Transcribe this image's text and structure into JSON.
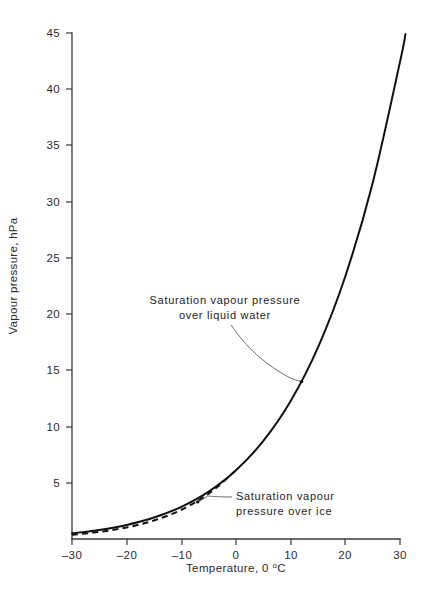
{
  "figure": {
    "background_color": "#ffffff",
    "line_color": "#101010",
    "axis_color": "#3a3a3a",
    "leader_color": "#5a5a5a"
  },
  "annotations": {
    "water_line1": "Saturation vapour pressure",
    "water_line2": "over liquid water",
    "ice_line1": "Saturation vapour",
    "ice_line2": "pressure over ice"
  },
  "axis_titles": {
    "y": "Vapour pressure, hPa",
    "x_prefix": "Temperature, 0 ",
    "x_degree": "o",
    "x_suffix": "C"
  },
  "caption": "",
  "chart_data": {
    "type": "line",
    "title": "",
    "subtitle": "",
    "xlabel": "Temperature, 0 °C",
    "ylabel": "Vapour pressure, hPa",
    "xlim": [
      -30,
      30
    ],
    "ylim": [
      0,
      45
    ],
    "xticks": [
      -30,
      -20,
      -10,
      0,
      10,
      20,
      30
    ],
    "xtick_labels": [
      "–30",
      "–20",
      "–10",
      "0",
      "10",
      "20",
      "30"
    ],
    "yticks": [
      5,
      10,
      15,
      20,
      25,
      30,
      35,
      40,
      45
    ],
    "ytick_labels": [
      "5",
      "10",
      "15",
      "20",
      "25",
      "30",
      "35",
      "40",
      "45"
    ],
    "grid": false,
    "legend": "annotations-with-leader-lines",
    "series": [
      {
        "name": "Saturation vapour pressure over liquid water",
        "style": "solid",
        "x": [
          -30,
          -25,
          -20,
          -15,
          -10,
          -5,
          0,
          5,
          10,
          15,
          20,
          25,
          30,
          31
        ],
        "values": [
          0.51,
          0.81,
          1.25,
          1.91,
          2.86,
          4.21,
          6.11,
          8.72,
          12.27,
          17.04,
          23.37,
          31.67,
          42.43,
          44.9
        ]
      },
      {
        "name": "Saturation vapour pressure over ice",
        "style": "dashed",
        "x": [
          -30,
          -25,
          -20,
          -15,
          -10,
          -5,
          0
        ],
        "values": [
          0.38,
          0.63,
          1.03,
          1.65,
          2.6,
          4.02,
          6.11
        ]
      }
    ],
    "annotation_points": [
      {
        "label": "Saturation vapour pressure over liquid water",
        "x": 12,
        "y": 14.0
      },
      {
        "label": "Saturation vapour pressure over ice",
        "x": -7,
        "y": 3.3
      }
    ]
  }
}
